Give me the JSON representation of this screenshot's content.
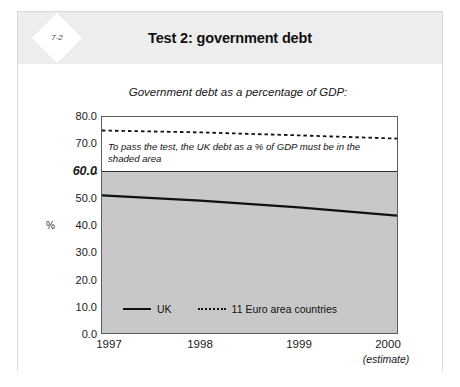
{
  "card": {
    "badge": "7-2",
    "title": "Test 2: government debt"
  },
  "chart_data": {
    "type": "line",
    "title": "Test 2: government debt",
    "subtitle": "Government debt as a percentage of GDP:",
    "xlabel": "",
    "ylabel": "%",
    "x": [
      1997,
      1998,
      1999,
      2000
    ],
    "xticklabels": [
      "1997",
      "1998",
      "1999",
      "2000"
    ],
    "x_note": "(estimate)",
    "xlim": [
      1997,
      2000
    ],
    "ylim": [
      0.0,
      80.0
    ],
    "yticklabels": [
      "0.0",
      "10.0",
      "20.0",
      "30.0",
      "40.0",
      "50.0",
      "60.0",
      "70.0",
      "80.0"
    ],
    "ytickvalues": [
      0.0,
      10.0,
      20.0,
      30.0,
      40.0,
      50.0,
      60.0,
      70.0,
      80.0
    ],
    "highlight_y": 60.0,
    "highlight_label": "60.0",
    "highlight_arrow": "→",
    "grid": false,
    "legend_position": "inside lower-left",
    "series": [
      {
        "name": "UK",
        "style": "solid",
        "color": "#111111",
        "values": [
          51.0,
          49.0,
          46.5,
          43.5
        ]
      },
      {
        "name": "11 Euro area countries",
        "style": "dotted",
        "color": "#111111",
        "values": [
          75.0,
          74.3,
          73.2,
          72.0
        ]
      }
    ],
    "shaded_region": {
      "label": "pass zone",
      "from": 0.0,
      "to": 60.0,
      "color": "#c8c8c8"
    },
    "annotation": "To pass the test, the UK debt as a % of GDP must be in the shaded area"
  },
  "colors": {
    "header_band": "#ededed",
    "shaded_area": "#c8c8c8",
    "line": "#111111",
    "plot_border": "#5d5d5d"
  }
}
